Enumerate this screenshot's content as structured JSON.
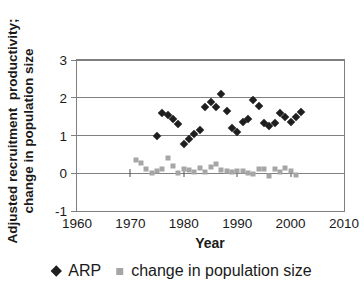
{
  "chart_data": {
    "type": "scatter",
    "title": "",
    "xlabel": "Year",
    "ylabel": "Adjusted recruitment productivity; change in population size",
    "ylabel_line1": "Adjusted recruitment  productivity;",
    "ylabel_line2": "change in population size",
    "xlim": [
      1960,
      2010
    ],
    "ylim": [
      -1,
      3
    ],
    "x_ticks": [
      1960,
      1970,
      1980,
      1990,
      2000,
      2010
    ],
    "y_ticks": [
      3,
      2,
      1,
      0,
      -1
    ],
    "x_axis_cross_ticks_at_y0": [
      1970,
      1980,
      1990,
      2000
    ],
    "grid": "horizontal",
    "legend_position": "bottom",
    "colors": {
      "arp": "#1f1f1f",
      "population": "#a6a6a6",
      "grid": "#808080",
      "text": "#1a1a1a"
    },
    "series": [
      {
        "name": "ARP",
        "marker": "diamond",
        "color": "#1f1f1f",
        "points": [
          [
            1975,
            1.0
          ],
          [
            1976,
            1.6
          ],
          [
            1977,
            1.55
          ],
          [
            1978,
            1.45
          ],
          [
            1979,
            1.3
          ],
          [
            1980,
            0.78
          ],
          [
            1981,
            0.92
          ],
          [
            1982,
            1.05
          ],
          [
            1983,
            1.15
          ],
          [
            1984,
            1.75
          ],
          [
            1985,
            1.9
          ],
          [
            1986,
            1.76
          ],
          [
            1987,
            2.1
          ],
          [
            1988,
            1.64
          ],
          [
            1989,
            1.2
          ],
          [
            1990,
            1.08
          ],
          [
            1991,
            1.35
          ],
          [
            1992,
            1.45
          ],
          [
            1993,
            1.95
          ],
          [
            1994,
            1.78
          ],
          [
            1995,
            1.33
          ],
          [
            1996,
            1.24
          ],
          [
            1997,
            1.34
          ],
          [
            1998,
            1.6
          ],
          [
            1999,
            1.48
          ],
          [
            2000,
            1.37
          ],
          [
            2001,
            1.5
          ],
          [
            2002,
            1.62
          ]
        ]
      },
      {
        "name": "change in population size",
        "marker": "square",
        "color": "#a6a6a6",
        "points": [
          [
            1971,
            0.35
          ],
          [
            1972,
            0.28
          ],
          [
            1973,
            0.1
          ],
          [
            1974,
            0.0
          ],
          [
            1975,
            0.06
          ],
          [
            1976,
            0.1
          ],
          [
            1977,
            0.4
          ],
          [
            1978,
            0.2
          ],
          [
            1979,
            0.0
          ],
          [
            1980,
            0.12
          ],
          [
            1981,
            0.08
          ],
          [
            1982,
            0.04
          ],
          [
            1983,
            0.15
          ],
          [
            1984,
            0.02
          ],
          [
            1985,
            0.17
          ],
          [
            1986,
            0.24
          ],
          [
            1987,
            0.08
          ],
          [
            1988,
            0.06
          ],
          [
            1989,
            0.03
          ],
          [
            1990,
            0.06
          ],
          [
            1991,
            0.05
          ],
          [
            1992,
            0.0
          ],
          [
            1993,
            -0.03
          ],
          [
            1994,
            0.1
          ],
          [
            1995,
            0.12
          ],
          [
            1996,
            -0.08
          ],
          [
            1997,
            0.1
          ],
          [
            1998,
            0.04
          ],
          [
            1999,
            0.15
          ],
          [
            2000,
            0.06
          ],
          [
            2001,
            -0.04
          ]
        ]
      }
    ]
  }
}
